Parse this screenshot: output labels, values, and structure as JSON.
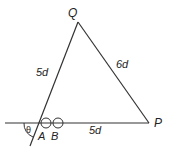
{
  "diagram": {
    "type": "geometry-triangle",
    "points": {
      "Q": {
        "label": "Q",
        "x": 78,
        "y": 22
      },
      "P": {
        "label": "P",
        "x": 149,
        "y": 123
      },
      "A": {
        "label": "A",
        "x": 44,
        "y": 123
      },
      "B": {
        "label": "B",
        "x": 57,
        "y": 123
      }
    },
    "sides": {
      "QA": {
        "label": "5d"
      },
      "QP": {
        "label": "6d"
      },
      "BP": {
        "label": "5d"
      }
    },
    "angle": {
      "label": "θ"
    },
    "line_color": "#333333"
  }
}
